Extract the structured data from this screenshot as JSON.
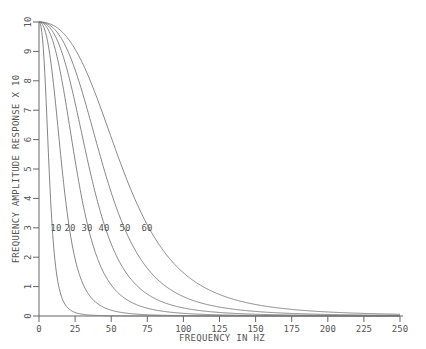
{
  "chart_data": {
    "type": "line",
    "title": "",
    "xlabel": "FREQUENCY IN HZ",
    "ylabel": "FREQUENCY AMPLITUDE RESPONSE X 10",
    "xlim": [
      0,
      250
    ],
    "ylim": [
      0,
      10
    ],
    "x_ticks": [
      0,
      25,
      50,
      75,
      100,
      125,
      150,
      175,
      200,
      225,
      250
    ],
    "y_ticks": [
      0,
      1,
      2,
      3,
      4,
      5,
      6,
      7,
      8,
      9,
      10
    ],
    "grid": false,
    "legend": "inline curve labels at y=3",
    "x": [
      0,
      5,
      10,
      15,
      20,
      25,
      30,
      40,
      50,
      60,
      75,
      100,
      125,
      150,
      175,
      200,
      225,
      250
    ],
    "series": [
      {
        "name": "10",
        "half_power_hz": 7,
        "values": [
          10,
          7.9,
          2.7,
          0.47,
          0.15,
          0.06,
          0.03,
          0.01,
          0.0,
          0.0,
          0.0,
          0.0,
          0.0,
          0.0,
          0.0,
          0.0,
          0.0,
          0.0
        ]
      },
      {
        "name": "20",
        "half_power_hz": 16,
        "values": [
          10,
          9.9,
          8.7,
          5.5,
          2.9,
          1.4,
          0.8,
          0.3,
          0.1,
          0.05,
          0.02,
          0.0,
          0.0,
          0.0,
          0.0,
          0.0,
          0.0,
          0.0
        ]
      },
      {
        "name": "30",
        "half_power_hz": 26,
        "values": [
          10,
          10,
          9.8,
          9.1,
          7.6,
          5.6,
          3.9,
          1.8,
          0.8,
          0.4,
          0.2,
          0.05,
          0.02,
          0.0,
          0.0,
          0.0,
          0.0,
          0.0
        ]
      },
      {
        "name": "40",
        "half_power_hz": 35,
        "values": [
          10,
          10,
          9.9,
          9.7,
          9.3,
          8.4,
          7.1,
          4.6,
          2.7,
          1.6,
          0.7,
          0.2,
          0.1,
          0.05,
          0.02,
          0.0,
          0.0,
          0.0
        ]
      },
      {
        "name": "50",
        "half_power_hz": 45,
        "values": [
          10,
          10,
          10,
          9.9,
          9.7,
          9.3,
          8.7,
          6.9,
          4.8,
          3.2,
          1.7,
          0.6,
          0.3,
          0.1,
          0.05,
          0.03,
          0.02,
          0.01
        ]
      },
      {
        "name": "60",
        "half_power_hz": 58,
        "values": [
          10,
          10,
          10,
          10,
          9.9,
          9.7,
          9.4,
          8.5,
          7.1,
          5.5,
          3.5,
          1.4,
          0.6,
          0.3,
          0.15,
          0.08,
          0.05,
          0.03
        ]
      }
    ],
    "curve_labels": [
      "10",
      "20",
      "30",
      "40",
      "50",
      "60"
    ],
    "curve_label_x_px": [
      56,
      70,
      87,
      104,
      125,
      147
    ],
    "curve_label_y_value": 3
  }
}
